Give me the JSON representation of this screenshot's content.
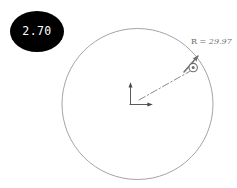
{
  "figure": {
    "type": "geometry-annotation",
    "background_color": "#ffffff",
    "stroke_color": "#8a8a8a",
    "badge": {
      "value": "2.70",
      "shape": "ellipse",
      "fill_color": "#000000",
      "text_color": "#ffffff"
    },
    "circle": {
      "center_x": 137,
      "center_y": 104,
      "radius_px": 75,
      "stroke_color": "#9a9a9a",
      "fill": "none"
    },
    "radius_annotation": {
      "symbol": "R =",
      "value": "29.97",
      "full_label": "R = 29.97",
      "line_style": "dash-dot",
      "has_arrowhead": true,
      "color": "#6e6e6e"
    },
    "marker": {
      "kind": "circle-with-center-dot",
      "x": 193,
      "y": 68,
      "color": "#6e6e6e"
    },
    "origin": {
      "kind": "coordinate-axes",
      "x": 137,
      "y": 104,
      "color": "#4a4a4a"
    }
  }
}
